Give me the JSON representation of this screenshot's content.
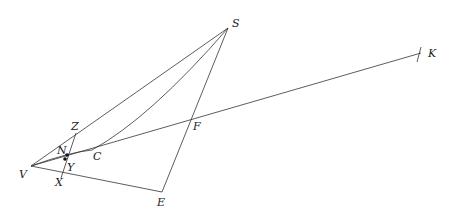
{
  "diagram": {
    "type": "geometric-construction",
    "points": {
      "S": {
        "label": "S",
        "x": 228,
        "y": 28
      },
      "K": {
        "label": "K",
        "x": 421,
        "y": 53
      },
      "Z": {
        "label": "Z",
        "x": 76,
        "y": 133
      },
      "N": {
        "label": "N",
        "x": 67,
        "y": 155
      },
      "Y": {
        "label": "Y",
        "x": 65,
        "y": 159
      },
      "C": {
        "label": "C",
        "x": 92,
        "y": 150
      },
      "F": {
        "label": "F",
        "x": 191,
        "y": 120
      },
      "V": {
        "label": "V",
        "x": 31,
        "y": 166
      },
      "X": {
        "label": "X",
        "x": 61,
        "y": 175
      },
      "E": {
        "label": "E",
        "x": 162,
        "y": 192
      }
    },
    "segments": [
      "VS",
      "VK",
      "VE",
      "SE",
      "ZX",
      "curve V-N-C-S"
    ]
  }
}
